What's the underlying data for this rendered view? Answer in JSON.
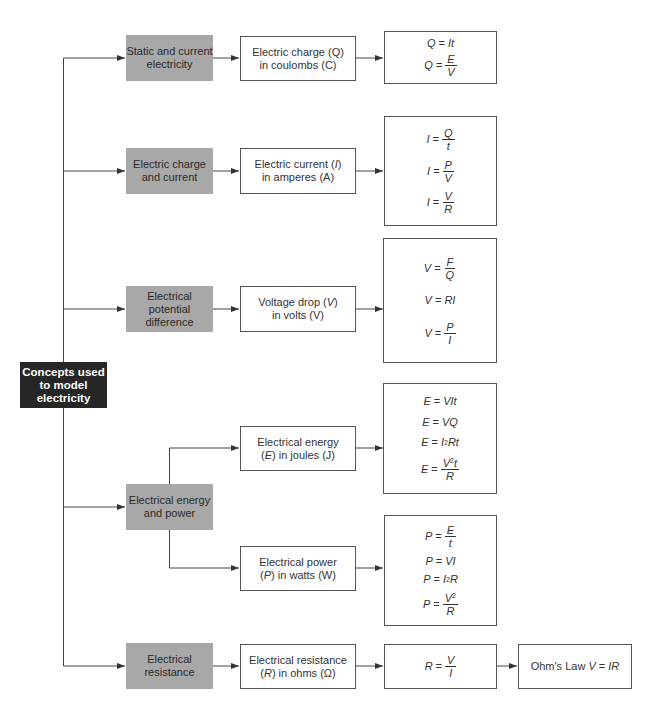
{
  "root": {
    "label_lines": [
      "Concepts used",
      "to model",
      "electricity"
    ]
  },
  "rows": [
    {
      "category": [
        "Static and current",
        "electricity"
      ],
      "quantity": {
        "line1_pre": "Electric charge (",
        "symbol": "Q",
        "line1_post": ")",
        "line2": "in coulombs (C)"
      },
      "formulas": [
        {
          "lhs": "Q",
          "type": "plain",
          "rhs": "It"
        },
        {
          "lhs": "Q",
          "type": "frac",
          "num": "E",
          "den": "V"
        }
      ]
    },
    {
      "category": [
        "Electric charge",
        "and current"
      ],
      "quantity": {
        "line1_pre": "Electric current (",
        "symbol": "I",
        "line1_post": ")",
        "line2": "in amperes (A)"
      },
      "formulas": [
        {
          "lhs": "I",
          "type": "frac",
          "num": "Q",
          "den": "t"
        },
        {
          "lhs": "I",
          "type": "frac",
          "num": "P",
          "den": "V"
        },
        {
          "lhs": "I",
          "type": "frac",
          "num": "V",
          "den": "R"
        }
      ]
    },
    {
      "category": [
        "Electrical potential",
        "difference"
      ],
      "quantity": {
        "line1_pre": "Voltage drop (",
        "symbol": "V",
        "line1_post": ")",
        "line2": "in volts (V)"
      },
      "formulas": [
        {
          "lhs": "V",
          "type": "frac",
          "num": "F",
          "den": "Q"
        },
        {
          "lhs": "V",
          "type": "plain",
          "rhs": "RI"
        },
        {
          "lhs": "V",
          "type": "frac",
          "num": "P",
          "den": "I"
        }
      ]
    },
    {
      "category": [
        "Electrical energy",
        "and power"
      ],
      "branches": [
        {
          "quantity": {
            "line1": "Electrical energy",
            "symbol": "E",
            "line2_post": ") in joules (J)"
          },
          "formulas": [
            {
              "lhs": "E",
              "type": "plain",
              "rhs": "VIt"
            },
            {
              "lhs": "E",
              "type": "plain",
              "rhs": "VQ"
            },
            {
              "lhs": "E",
              "type": "sup",
              "base": "I",
              "exp": "2",
              "rest": "Rt"
            },
            {
              "lhs": "E",
              "type": "fracsup",
              "num_base": "V",
              "num_exp": "2",
              "num_rest": "t",
              "den": "R"
            }
          ]
        },
        {
          "quantity": {
            "line1": "Electrical power",
            "symbol": "P",
            "line2_post": ") in watts (W)"
          },
          "formulas": [
            {
              "lhs": "P",
              "type": "frac",
              "num": "E",
              "den": "t"
            },
            {
              "lhs": "P",
              "type": "plain",
              "rhs": "VI"
            },
            {
              "lhs": "P",
              "type": "sup",
              "base": "I",
              "exp": "2",
              "rest": "R"
            },
            {
              "lhs": "P",
              "type": "fracsup",
              "num_base": "V",
              "num_exp": "2",
              "num_rest": "",
              "den": "R"
            }
          ]
        }
      ]
    },
    {
      "category": [
        "Electrical",
        "resistance"
      ],
      "quantity": {
        "line1": "Electrical resistance",
        "symbol": "R",
        "line2_post": ") in ohms (Ω)"
      },
      "formulas": [
        {
          "lhs": "R",
          "type": "frac",
          "num": "V",
          "den": "I"
        }
      ],
      "law": {
        "text": "Ohm's Law ",
        "lhs": "V",
        "eq": " = ",
        "rhs": "IR"
      }
    }
  ],
  "colors": {
    "root_bg": "#262626",
    "category_bg": "#a8a8a8",
    "border": "#555555",
    "line": "#444444"
  }
}
